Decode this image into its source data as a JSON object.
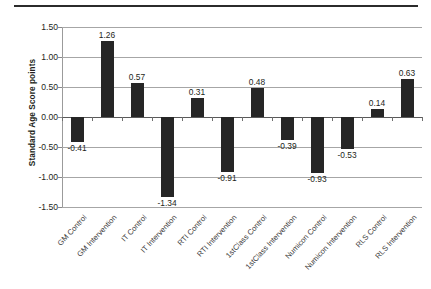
{
  "figure": {
    "y_axis_title": "Standard Age Score points"
  },
  "chart_data": {
    "type": "bar",
    "title": "",
    "xlabel": "",
    "ylabel": "Standard Age Score points",
    "ylim": [
      -1.5,
      1.5
    ],
    "ytick_labels": [
      "1.50",
      "1.00",
      "0.50",
      "0.00",
      "-0.50",
      "-1.00",
      "-1.50"
    ],
    "ytick_values": [
      1.5,
      1.0,
      0.5,
      0.0,
      -0.5,
      -1.0,
      -1.5
    ],
    "grid": true,
    "legend": "none",
    "bar_color": "#262626",
    "categories": [
      "GM Control",
      "GM Intervention",
      "IT Control",
      "IT Intervention",
      "RTI Control",
      "RTI Intervention",
      "1stClass Control",
      "1stClass Intervention",
      "Numicon Control",
      "Numicon Intervention",
      "RLS Control",
      "RLS Intervention"
    ],
    "values": [
      -0.41,
      1.26,
      0.57,
      -1.34,
      0.31,
      -0.91,
      0.48,
      -0.39,
      -0.93,
      -0.53,
      0.14,
      0.63
    ],
    "data_labels": [
      "-0.41",
      "1.26",
      "0.57",
      "-1.34",
      "0.31",
      "-0.91",
      "0.48",
      "-0.39",
      "-0.93",
      "-0.53",
      "0.14",
      "0.63"
    ]
  }
}
